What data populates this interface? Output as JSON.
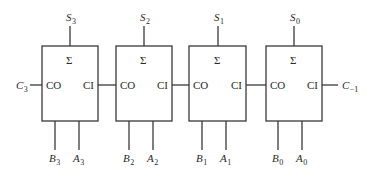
{
  "diagram": {
    "type": "4-bit ripple carry adder",
    "adders": [
      {
        "sigma": "Σ",
        "co": "CO",
        "ci": "CI",
        "sum": {
          "name": "S",
          "index": "3"
        },
        "b": {
          "name": "B",
          "index": "3"
        },
        "a": {
          "name": "A",
          "index": "3"
        }
      },
      {
        "sigma": "Σ",
        "co": "CO",
        "ci": "CI",
        "sum": {
          "name": "S",
          "index": "2"
        },
        "b": {
          "name": "B",
          "index": "2"
        },
        "a": {
          "name": "A",
          "index": "2"
        }
      },
      {
        "sigma": "Σ",
        "co": "CO",
        "ci": "CI",
        "sum": {
          "name": "S",
          "index": "1"
        },
        "b": {
          "name": "B",
          "index": "1"
        },
        "a": {
          "name": "A",
          "index": "1"
        }
      },
      {
        "sigma": "Σ",
        "co": "CO",
        "ci": "CI",
        "sum": {
          "name": "S",
          "index": "0"
        },
        "b": {
          "name": "B",
          "index": "0"
        },
        "a": {
          "name": "A",
          "index": "0"
        }
      }
    ],
    "carry_out": {
      "name": "C",
      "index": "3"
    },
    "carry_in": {
      "name": "C",
      "index": "−1"
    }
  }
}
